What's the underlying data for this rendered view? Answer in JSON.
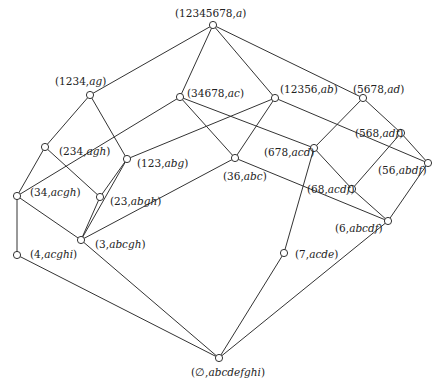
{
  "diagram": {
    "type": "concept-lattice",
    "nodes": [
      {
        "id": "top",
        "extent": "12345678",
        "intent": "a",
        "x": 213,
        "y": 25,
        "lx": 175,
        "ly": 17
      },
      {
        "id": "n1234",
        "extent": "1234",
        "intent": "ag",
        "x": 90,
        "y": 95,
        "lx": 55,
        "ly": 85
      },
      {
        "id": "n34678",
        "extent": "34678",
        "intent": "ac",
        "x": 180,
        "y": 97,
        "lx": 187,
        "ly": 97
      },
      {
        "id": "n12356",
        "extent": "12356",
        "intent": "ab",
        "x": 275,
        "y": 98,
        "lx": 280,
        "ly": 93
      },
      {
        "id": "n5678",
        "extent": "5678",
        "intent": "ad",
        "x": 363,
        "y": 98,
        "lx": 353,
        "ly": 93
      },
      {
        "id": "n568",
        "extent": "568",
        "intent": "adf",
        "x": 401,
        "y": 133,
        "lx": 355,
        "ly": 137
      },
      {
        "id": "n234",
        "extent": "234",
        "intent": "agh",
        "x": 45,
        "y": 147,
        "lx": 59,
        "ly": 155
      },
      {
        "id": "n123",
        "extent": "123",
        "intent": "abg",
        "x": 127,
        "y": 159,
        "lx": 137,
        "ly": 167
      },
      {
        "id": "n678",
        "extent": "678",
        "intent": "acd",
        "x": 314,
        "y": 148,
        "lx": 264,
        "ly": 156
      },
      {
        "id": "n36",
        "extent": "36",
        "intent": "abc",
        "x": 235,
        "y": 158,
        "lx": 223,
        "ly": 180
      },
      {
        "id": "n56",
        "extent": "56",
        "intent": "abdf",
        "x": 428,
        "y": 163,
        "lx": 378,
        "ly": 174
      },
      {
        "id": "n34",
        "extent": "34",
        "intent": "acgh",
        "x": 17,
        "y": 196,
        "lx": 30,
        "ly": 196
      },
      {
        "id": "n23",
        "extent": "23",
        "intent": "abgh",
        "x": 100,
        "y": 197,
        "lx": 110,
        "ly": 205
      },
      {
        "id": "n68",
        "extent": "68",
        "intent": "acdf",
        "x": 352,
        "y": 189,
        "lx": 307,
        "ly": 193
      },
      {
        "id": "n6",
        "extent": "6",
        "intent": "abcdf",
        "x": 388,
        "y": 221,
        "lx": 335,
        "ly": 232
      },
      {
        "id": "n3",
        "extent": "3",
        "intent": "abcgh",
        "x": 81,
        "y": 240,
        "lx": 95,
        "ly": 248
      },
      {
        "id": "n4",
        "extent": "4",
        "intent": "acghi",
        "x": 17,
        "y": 255,
        "lx": 30,
        "ly": 258
      },
      {
        "id": "n7",
        "extent": "7",
        "intent": "acde",
        "x": 284,
        "y": 253,
        "lx": 295,
        "ly": 258
      },
      {
        "id": "bottom",
        "extent": "∅",
        "intent": "abcdefghi",
        "x": 219,
        "y": 358,
        "lx": 191,
        "ly": 376
      }
    ],
    "edges": [
      [
        "top",
        "n1234"
      ],
      [
        "top",
        "n34678"
      ],
      [
        "top",
        "n12356"
      ],
      [
        "top",
        "n5678"
      ],
      [
        "n1234",
        "n234"
      ],
      [
        "n1234",
        "n123"
      ],
      [
        "n34678",
        "n34"
      ],
      [
        "n34678",
        "n36"
      ],
      [
        "n34678",
        "n678"
      ],
      [
        "n12356",
        "n123"
      ],
      [
        "n12356",
        "n36"
      ],
      [
        "n12356",
        "n56"
      ],
      [
        "n5678",
        "n678"
      ],
      [
        "n5678",
        "n568"
      ],
      [
        "n568",
        "n68"
      ],
      [
        "n568",
        "n56"
      ],
      [
        "n234",
        "n34"
      ],
      [
        "n234",
        "n23"
      ],
      [
        "n123",
        "n23"
      ],
      [
        "n123",
        "n3"
      ],
      [
        "n678",
        "n68"
      ],
      [
        "n678",
        "n7"
      ],
      [
        "n36",
        "n3"
      ],
      [
        "n36",
        "n6"
      ],
      [
        "n56",
        "n6"
      ],
      [
        "n68",
        "n6"
      ],
      [
        "n34",
        "n3"
      ],
      [
        "n34",
        "n4"
      ],
      [
        "n23",
        "n3"
      ],
      [
        "n3",
        "bottom"
      ],
      [
        "n4",
        "bottom"
      ],
      [
        "n6",
        "bottom"
      ],
      [
        "n7",
        "bottom"
      ]
    ]
  }
}
